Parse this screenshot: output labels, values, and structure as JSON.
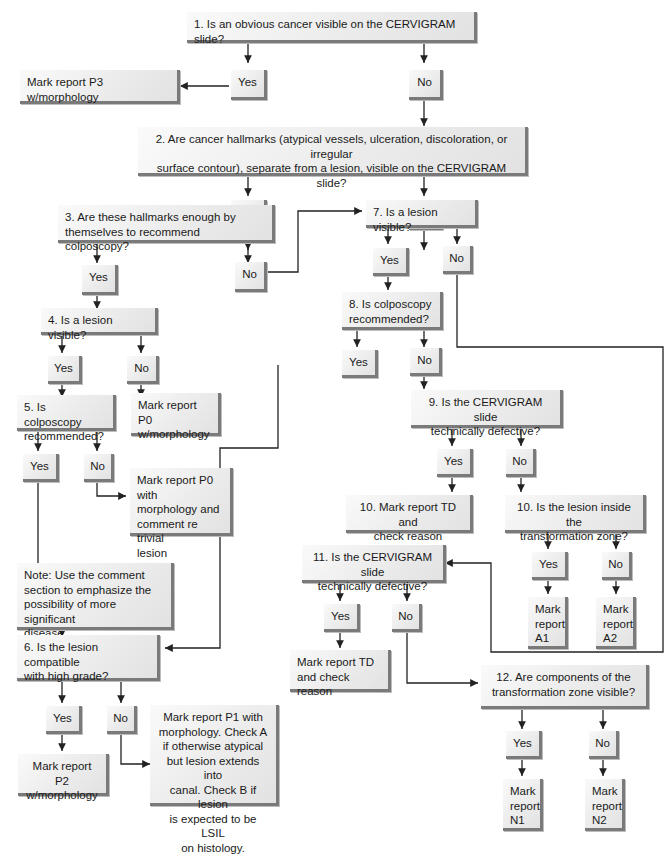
{
  "diagram": {
    "type": "flowchart",
    "colors": {
      "box_fill": "#ececec",
      "box_shadow": "#7a7a7a",
      "line": "#222222",
      "background": "#ffffff"
    },
    "nodes": {
      "q1": "1. Is an obvious cancer visible on the CERVIGRAM slide?",
      "q1_yes": "Yes",
      "q1_no": "No",
      "r_p3": "Mark report P3 w/morphology",
      "q2": "2. Are cancer hallmarks (atypical vessels, ulceration, discoloration, or irregular\n surface contour), separate from a  lesion, visible on the CERVIGRAM slide?",
      "q2_yes": "Yes",
      "q2_no": "No",
      "q3": "3. Are these hallmarks enough by\n   themselves to recommend colposcopy?",
      "q3_yes": "Yes",
      "q3_no": "No",
      "q4": "4. Is a lesion visible?",
      "q4_yes": "Yes",
      "q4_no": "No",
      "r_p0_morph": "Mark report P0\nw/morphology",
      "q5": "5. Is colposcopy\n   recommended?",
      "q5_yes": "Yes",
      "q5_no": "No",
      "r_p0_trivial": "Mark report P0 with\nmorphology and\ncomment re trivial\nlesion",
      "note": "Note: Use the comment\nsection to emphasize the\npossibility of more significant\ndisease.",
      "q6": "6. Is the lesion compatible\n   with high grade?",
      "q6_yes": "Yes",
      "q6_no": "No",
      "r_p2": "Mark report P2\nw/morphology",
      "r_p1": "Mark report P1 with\nmorphology.  Check A\nif otherwise atypical\nbut lesion extends into\ncanal.  Check B if lesion\nis expected to be LSIL\non histology.",
      "q7": "7. Is a lesion visible?",
      "q7_yes": "Yes",
      "q7_no": "No",
      "q8": "8. Is colposcopy\n   recommended?",
      "q8_yes": "Yes",
      "q8_no": "No",
      "q9": "9. Is the CERVIGRAM slide\n   technically defective?",
      "q9_yes": "Yes",
      "q9_no": "No",
      "r_td10": "10. Mark report TD and\n   check reason",
      "q10": "10. Is the lesion inside the\n    transformation zone?",
      "q10_yes": "Yes",
      "q10_no": "No",
      "r_a1": "Mark\nreport\nA1",
      "r_a2": "Mark\nreport\nA2",
      "q11": "11. Is the CERVIGRAM slide\n   technically defective?",
      "q11_yes": "Yes",
      "q11_no": "No",
      "r_td11": "Mark report TD\nand check reason",
      "q12": "12. Are components of the\n    transformation zone visible?",
      "q12_yes": "Yes",
      "q12_no": "No",
      "r_n1": "Mark\nreport\nN1",
      "r_n2": "Mark\nreport\nN2"
    }
  }
}
